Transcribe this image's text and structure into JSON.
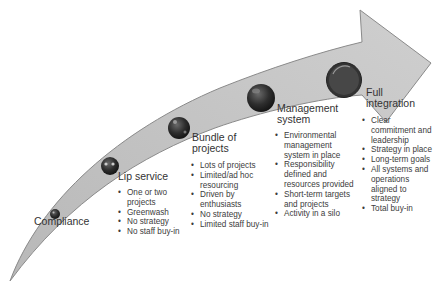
{
  "diagram": {
    "type": "maturity-arrow",
    "colors": {
      "arrow_fill": "#c8c8c8",
      "arrow_stroke": "#8a8a8a",
      "ball_dark": "#2a2a2a",
      "text": "#3a3a3a"
    },
    "stages": [
      {
        "title": "Compliance",
        "bullets": []
      },
      {
        "title": "Lip service",
        "bullets": [
          "One or two projects",
          "Greenwash",
          "No strategy",
          "No staff buy-in"
        ]
      },
      {
        "title_line1": "Bundle of",
        "title_line2": "projects",
        "bullets": [
          "Lots of projects",
          "Limited/ad hoc resourcing",
          "Driven by enthusiasts",
          "No strategy",
          "Limited staff buy-in"
        ]
      },
      {
        "title_line1": "Management",
        "title_line2": "system",
        "bullets": [
          "Environmental management system in place",
          "Responsibility defined and resources provided",
          "Short-term targets and projects",
          "Activity in a silo"
        ]
      },
      {
        "title_line1": "Full",
        "title_line2": "integration",
        "bullets": [
          "Clear commitment and leadership",
          "Strategy in place",
          "Long-term goals",
          "All systems and operations aligned to strategy",
          "Total buy-in"
        ]
      }
    ]
  }
}
